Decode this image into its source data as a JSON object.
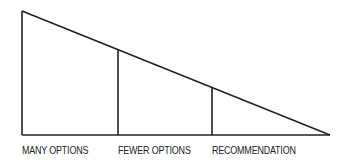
{
  "diagram": {
    "type": "funnel-triangle",
    "stroke_color": "#222222",
    "stages": [
      {
        "label": "MANY OPTIONS"
      },
      {
        "label": "FEWER OPTIONS"
      },
      {
        "label": "RECOMMENDATION"
      }
    ]
  }
}
